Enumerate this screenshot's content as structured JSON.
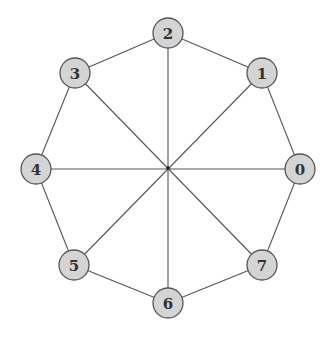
{
  "diagram": {
    "type": "graph",
    "center": [
      168,
      168
    ],
    "node_radius": 15,
    "colors": {
      "node_fill": "#d4d4d4",
      "node_stroke": "#555555",
      "edge": "#555555",
      "label": "#333333",
      "background": "#ffffff"
    },
    "nodes": [
      {
        "id": "0",
        "label": "0",
        "x": 300,
        "y": 169
      },
      {
        "id": "1",
        "label": "1",
        "x": 262,
        "y": 73
      },
      {
        "id": "2",
        "label": "2",
        "x": 168,
        "y": 33
      },
      {
        "id": "3",
        "label": "3",
        "x": 75,
        "y": 73
      },
      {
        "id": "4",
        "label": "4",
        "x": 36,
        "y": 169
      },
      {
        "id": "5",
        "label": "5",
        "x": 74,
        "y": 265
      },
      {
        "id": "6",
        "label": "6",
        "x": 168,
        "y": 303
      },
      {
        "id": "7",
        "label": "7",
        "x": 262,
        "y": 265
      }
    ],
    "edges": [
      [
        "0",
        "1"
      ],
      [
        "1",
        "2"
      ],
      [
        "2",
        "3"
      ],
      [
        "3",
        "4"
      ],
      [
        "4",
        "5"
      ],
      [
        "5",
        "6"
      ],
      [
        "6",
        "7"
      ],
      [
        "7",
        "0"
      ],
      [
        "0",
        "4"
      ],
      [
        "1",
        "5"
      ],
      [
        "2",
        "6"
      ],
      [
        "3",
        "7"
      ]
    ]
  }
}
